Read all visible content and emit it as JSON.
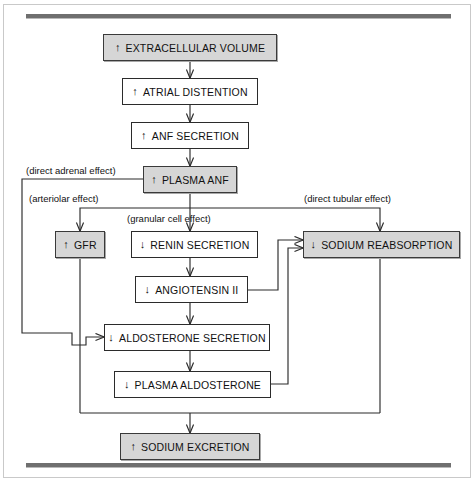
{
  "figure": {
    "type": "flowchart"
  },
  "nodes": [
    {
      "id": "extracellular-volume",
      "arrow": "↑",
      "label": "EXTRACELLULAR VOLUME",
      "shaded": true
    },
    {
      "id": "atrial-distention",
      "arrow": "↑",
      "label": "ATRIAL DISTENTION",
      "shaded": false
    },
    {
      "id": "anf-secretion",
      "arrow": "↑",
      "label": "ANF SECRETION",
      "shaded": false
    },
    {
      "id": "plasma-anf",
      "arrow": "↑",
      "label": "PLASMA ANF",
      "shaded": true
    },
    {
      "id": "gfr",
      "arrow": "↑",
      "label": "GFR",
      "shaded": true
    },
    {
      "id": "renin-secretion",
      "arrow": "↓",
      "label": "RENIN SECRETION",
      "shaded": false
    },
    {
      "id": "angiotensin-ii",
      "arrow": "↓",
      "label": "ANGIOTENSIN II",
      "shaded": false
    },
    {
      "id": "aldosterone-secretion",
      "arrow": "↓",
      "label": "ALDOSTERONE SECRETION",
      "shaded": false
    },
    {
      "id": "plasma-aldosterone",
      "arrow": "↓",
      "label": "PLASMA ALDOSTERONE",
      "shaded": false
    },
    {
      "id": "sodium-reabsorption",
      "arrow": "↓",
      "label": "SODIUM REABSORPTION",
      "shaded": true
    },
    {
      "id": "sodium-excretion",
      "arrow": "↑",
      "label": "SODIUM EXCRETION",
      "shaded": true
    }
  ],
  "captions": [
    {
      "id": "direct-adrenal-effect",
      "text": "(direct adrenal effect)"
    },
    {
      "id": "arteriolar-effect",
      "text": "(arteriolar effect)"
    },
    {
      "id": "granular-cell-effect",
      "text": "(granular cell effect)"
    },
    {
      "id": "direct-tubular-effect",
      "text": "(direct tubular effect)"
    }
  ],
  "edges": [
    {
      "from": "extracellular-volume",
      "to": "atrial-distention"
    },
    {
      "from": "atrial-distention",
      "to": "anf-secretion"
    },
    {
      "from": "anf-secretion",
      "to": "plasma-anf"
    },
    {
      "from": "plasma-anf",
      "to": "aldosterone-secretion",
      "caption": "(direct adrenal effect)"
    },
    {
      "from": "plasma-anf",
      "to": "gfr",
      "caption": "(arteriolar effect)"
    },
    {
      "from": "plasma-anf",
      "to": "renin-secretion",
      "caption": "(granular cell effect)"
    },
    {
      "from": "plasma-anf",
      "to": "sodium-reabsorption",
      "caption": "(direct tubular effect)"
    },
    {
      "from": "renin-secretion",
      "to": "angiotensin-ii"
    },
    {
      "from": "angiotensin-ii",
      "to": "aldosterone-secretion"
    },
    {
      "from": "angiotensin-ii",
      "to": "sodium-reabsorption"
    },
    {
      "from": "aldosterone-secretion",
      "to": "plasma-aldosterone"
    },
    {
      "from": "plasma-aldosterone",
      "to": "sodium-reabsorption"
    },
    {
      "from": "gfr",
      "to": "sodium-excretion"
    },
    {
      "from": "sodium-reabsorption",
      "to": "sodium-excretion"
    }
  ],
  "colors": {
    "shaded_fill": "#d6d6d6",
    "line": "#2b2b2b",
    "rule": "#6f6f6f",
    "text": "#111111"
  }
}
